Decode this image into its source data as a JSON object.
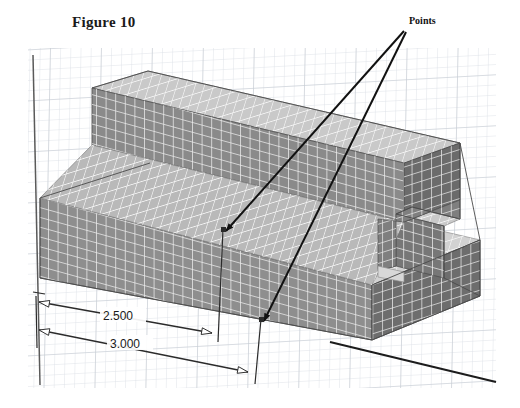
{
  "figure": {
    "title": "Figure 10",
    "caption_position": "top-left"
  },
  "annotations": {
    "points_label": "Points",
    "leader_count": 2
  },
  "dimensions": [
    {
      "label": "2.500",
      "name": "dim-2500"
    },
    {
      "label": "3.000",
      "name": "dim-3000"
    }
  ],
  "colors": {
    "background": "#ffffff",
    "grid_minor": "#dfe3e8",
    "grid_major": "#c2c8cf",
    "face_front": "#8e8e8e",
    "face_top": "#cfcfcf",
    "face_side": "#6f6f6f",
    "face_inner": "#7c7c7c",
    "mesh_line": "#f2f2f2",
    "outline": "#4a4a4a",
    "leader": "#111111",
    "dimension_line": "#2b2b2b",
    "text": "#1a1a1a"
  },
  "view": {
    "projection": "isometric",
    "shading": "shaded-with-mesh",
    "grid_visible": true
  }
}
